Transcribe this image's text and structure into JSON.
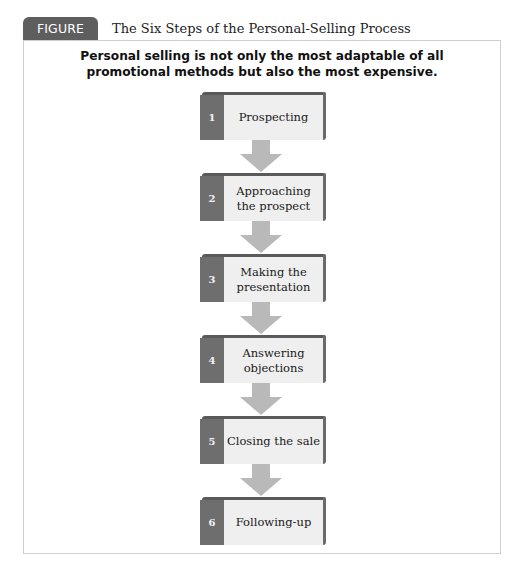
{
  "figure": {
    "label": "FIGURE 15.4",
    "title": "The Six Steps of the Personal-Selling Process",
    "subtitle": "Personal selling is not only the most adaptable of all promotional methods but also the most expensive."
  },
  "colors": {
    "tab": "#5e5e5e",
    "number_block": "#6e6e6e",
    "step_face": "#efefef",
    "arrow": "#b9b9b9",
    "frame_border": "#cfcfcf"
  },
  "steps": [
    {
      "number": "1",
      "label": "Prospecting"
    },
    {
      "number": "2",
      "label": "Approaching the prospect"
    },
    {
      "number": "3",
      "label": "Making the presentation"
    },
    {
      "number": "4",
      "label": "Answering objections"
    },
    {
      "number": "5",
      "label": "Closing the sale"
    },
    {
      "number": "6",
      "label": "Following-up"
    }
  ]
}
